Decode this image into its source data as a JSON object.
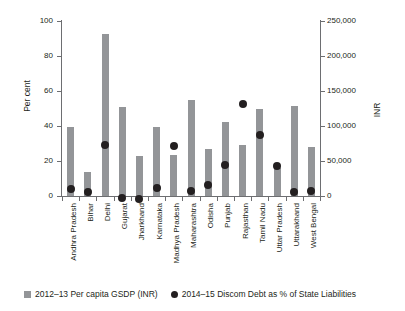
{
  "chart_data": {
    "type": "bar",
    "title": "",
    "subtitle": "",
    "xlabel": "",
    "ylabel": "Per cent",
    "ylabel_secondary": "INR",
    "ylim": [
      0,
      100
    ],
    "ylim_secondary": [
      0,
      250000
    ],
    "grid": false,
    "legend_position": "bottom",
    "categories": [
      "Andhra Pradesh",
      "Bihar",
      "Delhi",
      "Gujarat",
      "Jharkhand",
      "Karnataka",
      "Madhya Pradesh",
      "Maharashtra",
      "Odisha",
      "Punjab",
      "Rajasthan",
      "Tamil Nadu",
      "Uttar Pradesh",
      "Uttarakhand",
      "West Bengal"
    ],
    "y_ticks_left": [
      "0",
      "20",
      "40",
      "60",
      "80",
      "100"
    ],
    "y_tick_values_left": [
      0,
      20,
      40,
      60,
      80,
      100
    ],
    "y_ticks_right": [
      "0",
      "50,000",
      "100,000",
      "150,000",
      "200,000",
      "250,000"
    ],
    "y_tick_values_right": [
      0,
      50000,
      100000,
      150000,
      200000,
      250000
    ],
    "series": [
      {
        "name": "2012–13 Per capita GSDP (INR)",
        "type": "bar",
        "axis": "right",
        "color": "#939598",
        "unit": "INR",
        "values": [
          98500,
          34300,
          231500,
          127500,
          57500,
          98500,
          58800,
          136800,
          66500,
          106000,
          72500,
          124300,
          40000,
          129300,
          70000
        ],
        "values_percent_scale": [
          39.4,
          13.7,
          92.6,
          51.0,
          23.0,
          39.4,
          23.5,
          54.7,
          26.6,
          42.4,
          29.0,
          49.7,
          16.0,
          51.7,
          28.0
        ]
      },
      {
        "name": "2014–15 Discom Debt as % of State Liabilities",
        "type": "scatter",
        "axis": "left",
        "color": "#231f20",
        "unit": "per cent",
        "values": [
          6.5,
          4.3,
          31.5,
          1.3,
          0.6,
          6.6,
          31.0,
          5.4,
          8.4,
          19.8,
          54.8,
          37.2,
          19.2,
          4.4,
          4.9
        ]
      }
    ]
  },
  "legend": {
    "items": [
      {
        "marker": "bar-swatch",
        "label": "2012–13 Per capita GSDP (INR)"
      },
      {
        "marker": "dot-swatch",
        "label": "2014–15 Discom Debt as % of State Liabilities"
      }
    ]
  }
}
